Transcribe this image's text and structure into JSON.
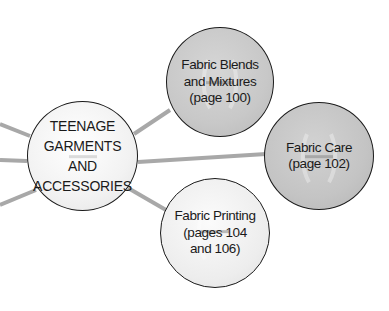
{
  "diagram": {
    "type": "mind-map",
    "colors": {
      "link": "#a8a8a8",
      "outline": "#1a1a1a",
      "center_fill": "#f2f2f2",
      "dark_node_fill": "#c6c6c6",
      "light_node_fill": "#eeeeee"
    },
    "center": {
      "label": "TEENAGE\nGARMENTS AND\nACCESSORIES"
    },
    "nodes": [
      {
        "id": "blends",
        "label": "Fabric Blends\nand Mixtures\n(page 100)"
      },
      {
        "id": "care",
        "label": "Fabric Care\n(page 102)"
      },
      {
        "id": "printing",
        "label": "Fabric Printing\n(pages 104\nand 106)"
      }
    ]
  }
}
